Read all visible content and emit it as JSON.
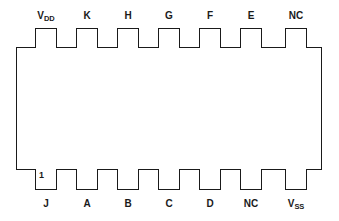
{
  "diagram": {
    "type": "ic-pinout-dual-inline-package",
    "package": {
      "pin_count": 14,
      "pins_per_side": 7
    },
    "pin_one_marker": "1",
    "colors": {
      "outline": "#1a1a1a",
      "fill": "#ffffff",
      "background": "#ffffff",
      "text": "#1a1a1a"
    },
    "top_pins": [
      {
        "label_main": "V",
        "label_sub": "DD"
      },
      {
        "label_main": "K",
        "label_sub": ""
      },
      {
        "label_main": "H",
        "label_sub": ""
      },
      {
        "label_main": "G",
        "label_sub": ""
      },
      {
        "label_main": "F",
        "label_sub": ""
      },
      {
        "label_main": "E",
        "label_sub": ""
      },
      {
        "label_main": "NC",
        "label_sub": ""
      }
    ],
    "bottom_pins": [
      {
        "label_main": "J",
        "label_sub": ""
      },
      {
        "label_main": "A",
        "label_sub": ""
      },
      {
        "label_main": "B",
        "label_sub": ""
      },
      {
        "label_main": "C",
        "label_sub": ""
      },
      {
        "label_main": "D",
        "label_sub": ""
      },
      {
        "label_main": "NC",
        "label_sub": ""
      },
      {
        "label_main": "V",
        "label_sub": "SS"
      }
    ]
  }
}
